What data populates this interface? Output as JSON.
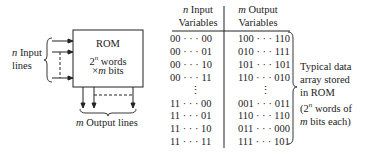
{
  "diagram": {
    "rom_block": {
      "line1": "ROM",
      "line2_base": "2",
      "line2_sup": "n",
      "line2_rest": " words",
      "line3_times": "×",
      "line3_m": "m",
      "line3_rest": " bits"
    },
    "input_label": {
      "var": "n",
      "line1": " Input",
      "line2": "lines"
    },
    "output_label": {
      "var": "m",
      "text": " Output lines"
    }
  },
  "table": {
    "headers": [
      {
        "var": "n",
        "line1": " Input",
        "line2": "Variables"
      },
      {
        "var": "m",
        "line1": " Output",
        "line2": "Variables"
      }
    ],
    "rows": [
      {
        "input": "00 · · · 00",
        "output": "100 · · · 110"
      },
      {
        "input": "00 · · · 01",
        "output": "010 · · · 111"
      },
      {
        "input": "00 · · · 10",
        "output": "101 · · · 101"
      },
      {
        "input": "00 · · · 11",
        "output": "110 · · · 010"
      },
      {
        "input": "⋮",
        "output": "⋮"
      },
      {
        "input": "11 · · · 00",
        "output": "001 · · · 011"
      },
      {
        "input": "11 · · · 01",
        "output": "110 · · · 110"
      },
      {
        "input": "11 · · · 10",
        "output": "011 · · · 000"
      },
      {
        "input": "11 · · · 11",
        "output": "111 · · · 101"
      }
    ],
    "annotation": {
      "l1": "Typical data",
      "l2": "array stored",
      "l3": "in ROM",
      "l4_open": "(2",
      "l4_sup": "n",
      "l4_rest": " words of",
      "l5_var": "m",
      "l5_rest": " bits each)"
    }
  }
}
